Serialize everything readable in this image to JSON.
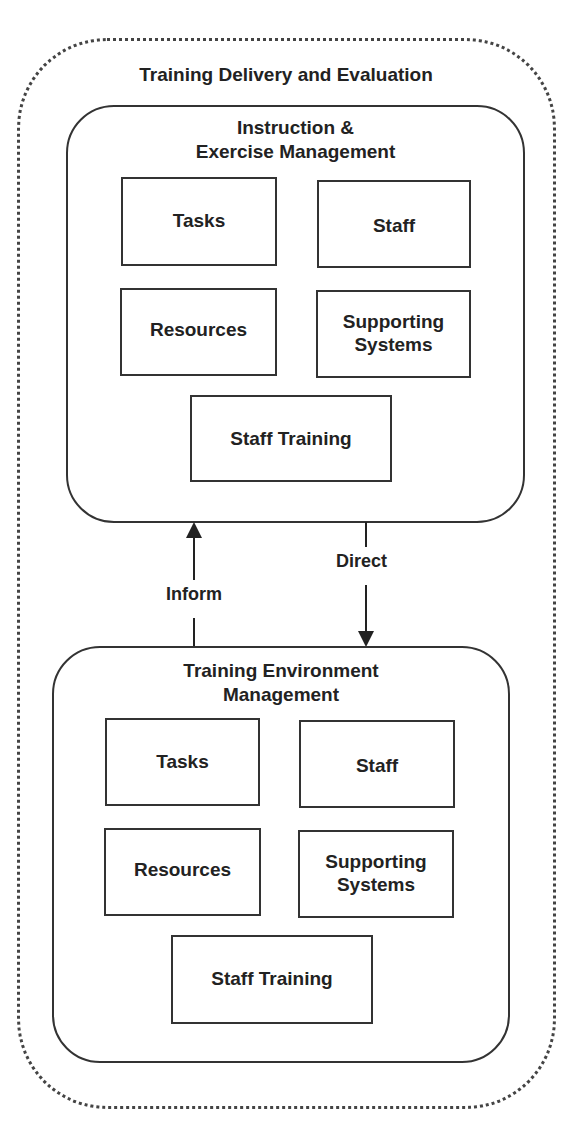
{
  "diagram": {
    "outer": {
      "title": "Training Delivery and Evaluation",
      "border_style": "dotted"
    },
    "groups": [
      {
        "title_line1": "Instruction &",
        "title_line2": "Exercise Management",
        "items": [
          {
            "label": "Tasks"
          },
          {
            "label": "Staff"
          },
          {
            "label": "Resources"
          },
          {
            "label_line1": "Supporting",
            "label_line2": "Systems"
          },
          {
            "label": "Staff Training"
          }
        ]
      },
      {
        "title_line1": "Training Environment",
        "title_line2": "Management",
        "items": [
          {
            "label": "Tasks"
          },
          {
            "label": "Staff"
          },
          {
            "label": "Resources"
          },
          {
            "label_line1": "Supporting",
            "label_line2": "Systems"
          },
          {
            "label": "Staff Training"
          }
        ]
      }
    ],
    "connectors": [
      {
        "label": "Inform",
        "from": "Training Environment Management",
        "to": "Instruction & Exercise Management",
        "direction": "up"
      },
      {
        "label": "Direct",
        "from": "Instruction & Exercise Management",
        "to": "Training Environment Management",
        "direction": "down"
      }
    ]
  }
}
